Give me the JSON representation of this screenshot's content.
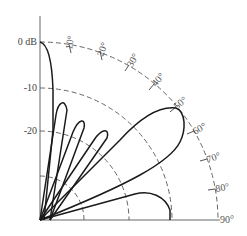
{
  "diagram": {
    "type": "polar-radiation-pattern",
    "radial_labels": [
      "0 dB",
      "-10",
      "-20"
    ],
    "angle_labels": [
      "10°",
      "20°",
      "30°",
      "40°",
      "50°",
      "60°",
      "70°",
      "80°",
      "90°"
    ],
    "colors": {
      "curve": "#1a1a1a",
      "grid": "#555555",
      "axis": "#666666"
    }
  }
}
